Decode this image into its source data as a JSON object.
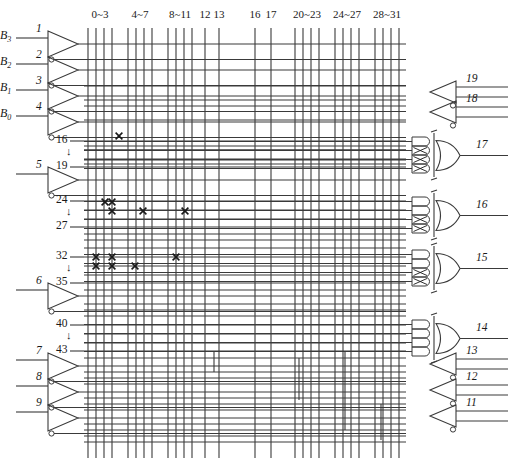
{
  "diagram": {
    "type": "logic-array-schematic",
    "line_color": "#3a3a3a",
    "mark_color": "#1a1a1a"
  },
  "column_headers": [
    {
      "label": "0~3",
      "x": 100,
      "lines": [
        88,
        96,
        104,
        112
      ]
    },
    {
      "label": "4~7",
      "x": 140,
      "lines": [
        128,
        136,
        144,
        152
      ]
    },
    {
      "label": "8~11",
      "x": 180,
      "lines": [
        168,
        176,
        184,
        192
      ]
    },
    {
      "label": "12",
      "x": 208,
      "lines": [
        205
      ]
    },
    {
      "label": "13",
      "x": 222,
      "lines": [
        219
      ]
    },
    {
      "label": "16",
      "x": 258,
      "lines": [
        255
      ]
    },
    {
      "label": "17",
      "x": 274,
      "lines": [
        271
      ]
    },
    {
      "label": "20~23",
      "x": 307,
      "lines": [
        295,
        303,
        311,
        319
      ]
    },
    {
      "label": "24~27",
      "x": 347,
      "lines": [
        335,
        343,
        351,
        359
      ]
    },
    {
      "label": "28~31",
      "x": 387,
      "lines": [
        375,
        383,
        391,
        399
      ]
    }
  ],
  "left_inputs": [
    {
      "pin": "1",
      "var": "B",
      "sub": "3",
      "y": 44
    },
    {
      "pin": "2",
      "var": "B",
      "sub": "2",
      "y": 70
    },
    {
      "pin": "3",
      "var": "B",
      "sub": "1",
      "y": 96
    },
    {
      "pin": "4",
      "var": "B",
      "sub": "0",
      "y": 122
    },
    {
      "pin": "5",
      "var": "",
      "sub": "",
      "y": 180
    },
    {
      "pin": "6",
      "var": "",
      "sub": "",
      "y": 296
    },
    {
      "pin": "7",
      "var": "",
      "sub": "",
      "y": 366
    },
    {
      "pin": "8",
      "var": "",
      "sub": "",
      "y": 392
    },
    {
      "pin": "9",
      "var": "",
      "sub": "",
      "y": 418
    }
  ],
  "row_groups": [
    {
      "top": "16",
      "mid": "↓",
      "bot": "19",
      "y_top": 141,
      "y_bot": 167
    },
    {
      "top": "24",
      "mid": "↓",
      "bot": "27",
      "y_top": 201,
      "y_bot": 227
    },
    {
      "top": "32",
      "mid": "↓",
      "bot": "35",
      "y_top": 257,
      "y_bot": 283
    },
    {
      "top": "40",
      "mid": "↓",
      "bot": "43",
      "y_top": 325,
      "y_bot": 351
    }
  ],
  "right_outputs": [
    {
      "pin": "19",
      "type": "buffer",
      "y": 92,
      "label": "",
      "sub": ""
    },
    {
      "pin": "18",
      "type": "buffer",
      "y": 112,
      "label": "",
      "sub": ""
    },
    {
      "pin": "17",
      "type": "or-gate",
      "y": 155,
      "label": "Y",
      "sub": "0"
    },
    {
      "pin": "16",
      "type": "or-gate",
      "y": 215,
      "label": "Y",
      "sub": "1"
    },
    {
      "pin": "15",
      "type": "or-gate",
      "y": 268,
      "label": "Y",
      "sub": "2"
    },
    {
      "pin": "14",
      "type": "or-gate",
      "y": 338,
      "label": "",
      "sub": ""
    },
    {
      "pin": "13",
      "type": "buffer",
      "y": 364,
      "label": "",
      "sub": ""
    },
    {
      "pin": "12",
      "type": "buffer",
      "y": 390,
      "label": "",
      "sub": ""
    },
    {
      "pin": "11",
      "type": "buffer",
      "y": 416,
      "label": "",
      "sub": ""
    }
  ],
  "fuse_marks": [
    {
      "x": 119,
      "y": 136
    },
    {
      "x": 105,
      "y": 202
    },
    {
      "x": 112,
      "y": 202
    },
    {
      "x": 112,
      "y": 211
    },
    {
      "x": 143,
      "y": 211
    },
    {
      "x": 185,
      "y": 211
    },
    {
      "x": 96,
      "y": 257
    },
    {
      "x": 112,
      "y": 257
    },
    {
      "x": 176,
      "y": 257
    },
    {
      "x": 96,
      "y": 266
    },
    {
      "x": 112,
      "y": 266
    },
    {
      "x": 135,
      "y": 266
    }
  ],
  "and_gate_fuses": {
    "17": [
      false,
      true,
      true,
      true
    ],
    "16": [
      false,
      false,
      true,
      true
    ],
    "15": [
      false,
      false,
      true,
      true
    ],
    "14": [
      false,
      false,
      false,
      false
    ]
  }
}
